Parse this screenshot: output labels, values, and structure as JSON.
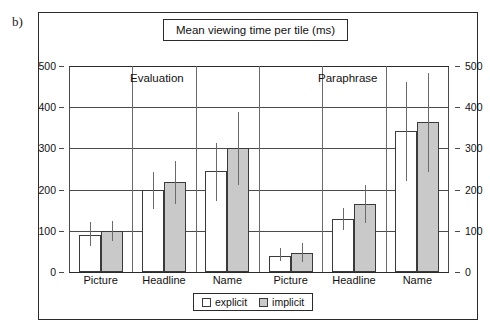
{
  "panel": {
    "letter": "b)"
  },
  "title": {
    "text": "Mean viewing time per tile (ms)"
  },
  "legend": {
    "items": [
      {
        "label": "explicit",
        "swatch": "white-square-icon",
        "color": "#ffffff"
      },
      {
        "label": "implicit",
        "swatch": "gray-square-icon",
        "color": "#c9c9c9"
      }
    ]
  },
  "group_labels": [
    {
      "text": "Evaluation"
    },
    {
      "text": "Paraphrase"
    }
  ],
  "axis": {
    "y_ticks_left": [
      "500",
      "400",
      "300",
      "200",
      "100",
      "0"
    ],
    "y_ticks_right": [
      "500",
      "400",
      "300",
      "200",
      "100",
      "0"
    ]
  },
  "chart_data": {
    "type": "bar",
    "title": "Mean viewing time per tile (ms)",
    "xlabel": "",
    "ylabel": "",
    "ylim": [
      0,
      500
    ],
    "yticks": [
      0,
      100,
      200,
      300,
      400,
      500
    ],
    "grid": true,
    "legend_position": "bottom",
    "error_bars": true,
    "groups": [
      "Evaluation",
      "Paraphrase"
    ],
    "categories": [
      "Picture",
      "Headline",
      "Name",
      "Picture",
      "Headline",
      "Name"
    ],
    "category_groups": [
      "Evaluation",
      "Evaluation",
      "Evaluation",
      "Paraphrase",
      "Paraphrase",
      "Paraphrase"
    ],
    "series": [
      {
        "name": "explicit",
        "color": "#ffffff",
        "values": [
          90,
          200,
          245,
          40,
          128,
          343
        ],
        "err_low": [
          62,
          152,
          173,
          27,
          103,
          220
        ],
        "err_high": [
          122,
          242,
          312,
          58,
          155,
          460
        ]
      },
      {
        "name": "implicit",
        "color": "#c9c9c9",
        "values": [
          100,
          218,
          300,
          47,
          165,
          365
        ],
        "err_low": [
          75,
          165,
          210,
          25,
          118,
          243
        ],
        "err_high": [
          125,
          270,
          388,
          70,
          212,
          483
        ]
      }
    ]
  }
}
